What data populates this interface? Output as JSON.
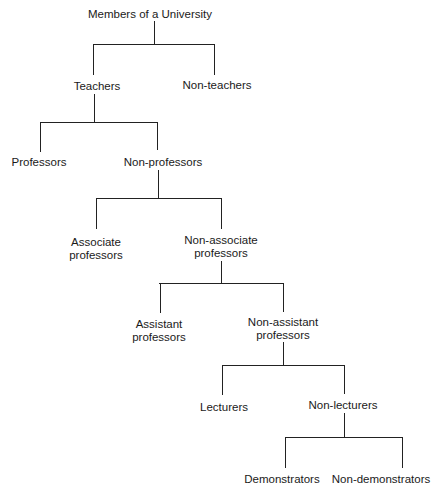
{
  "diagram": {
    "type": "binary-classification-tree",
    "root": "Members of a University",
    "nodes": [
      {
        "id": "root",
        "label": "Members of a University",
        "lines": [
          "Members of a University"
        ],
        "parent": null
      },
      {
        "id": "teachers",
        "label": "Teachers",
        "lines": [
          "Teachers"
        ],
        "parent": "root"
      },
      {
        "id": "non-teachers",
        "label": "Non-teachers",
        "lines": [
          "Non-teachers"
        ],
        "parent": "root"
      },
      {
        "id": "professors",
        "label": "Professors",
        "lines": [
          "Professors"
        ],
        "parent": "teachers"
      },
      {
        "id": "non-professors",
        "label": "Non-professors",
        "lines": [
          "Non-professors"
        ],
        "parent": "teachers"
      },
      {
        "id": "associate-professors",
        "label": "Associate professors",
        "lines": [
          "Associate",
          "professors"
        ],
        "parent": "non-professors"
      },
      {
        "id": "non-associate-professors",
        "label": "Non-associate professors",
        "lines": [
          "Non-associate",
          "professors"
        ],
        "parent": "non-professors"
      },
      {
        "id": "assistant-professors",
        "label": "Assistant professors",
        "lines": [
          "Assistant",
          "professors"
        ],
        "parent": "non-associate-professors"
      },
      {
        "id": "non-assistant-professors",
        "label": "Non-assistant professors",
        "lines": [
          "Non-assistant",
          "professors"
        ],
        "parent": "non-associate-professors"
      },
      {
        "id": "lecturers",
        "label": "Lecturers",
        "lines": [
          "Lecturers"
        ],
        "parent": "non-assistant-professors"
      },
      {
        "id": "non-lecturers",
        "label": "Non-lecturers",
        "lines": [
          "Non-lecturers"
        ],
        "parent": "non-assistant-professors"
      },
      {
        "id": "demonstrators",
        "label": "Demonstrators",
        "lines": [
          "Demonstrators"
        ],
        "parent": "non-lecturers"
      },
      {
        "id": "non-demonstrators",
        "label": "Non-demonstrators",
        "lines": [
          "Non-demonstrators"
        ],
        "parent": "non-lecturers"
      }
    ]
  },
  "labels": {
    "root": "Members of a University",
    "teachers": "Teachers",
    "non_teachers": "Non-teachers",
    "professors": "Professors",
    "non_professors": "Non-professors",
    "associate_1": "Associate",
    "associate_2": "professors",
    "non_associate_1": "Non-associate",
    "non_associate_2": "professors",
    "assistant_1": "Assistant",
    "assistant_2": "professors",
    "non_assistant_1": "Non-assistant",
    "non_assistant_2": "professors",
    "lecturers": "Lecturers",
    "non_lecturers": "Non-lecturers",
    "demonstrators": "Demonstrators",
    "non_demonstrators": "Non-demonstrators"
  },
  "colors": {
    "line": "#222222",
    "text": "#1a1a1a",
    "background": "#ffffff"
  }
}
